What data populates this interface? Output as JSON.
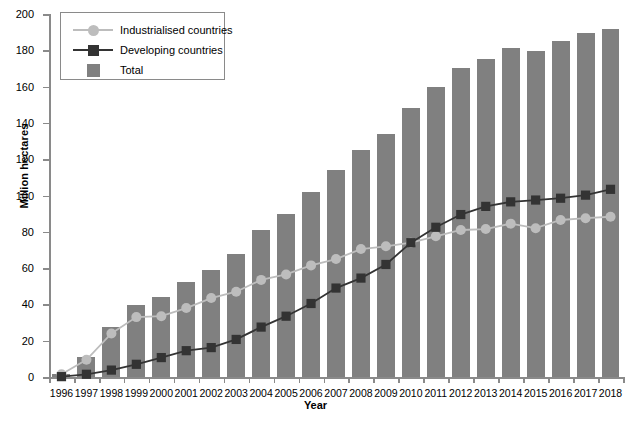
{
  "chart_data": {
    "type": "bar",
    "title": "",
    "xlabel": "Year",
    "ylabel": "Million hectares",
    "ylim": [
      0,
      200
    ],
    "ytick_step": 20,
    "yticks": [
      0,
      20,
      40,
      60,
      80,
      100,
      120,
      140,
      160,
      180,
      200
    ],
    "grid": false,
    "legend_position": "top-left",
    "categories": [
      "1996",
      "1997",
      "1998",
      "1999",
      "2000",
      "2001",
      "2002",
      "2003",
      "2004",
      "2005",
      "2006",
      "2007",
      "2008",
      "2009",
      "2010",
      "2011",
      "2012",
      "2013",
      "2014",
      "2015",
      "2016",
      "2017",
      "2018"
    ],
    "series": [
      {
        "name": "Total",
        "render": "bar",
        "color": "#808080",
        "values": [
          1.7,
          11.0,
          27.8,
          39.9,
          44.2,
          52.6,
          58.7,
          67.7,
          81.0,
          90.0,
          102.0,
          114.3,
          125.0,
          134.0,
          148.0,
          160.0,
          170.3,
          175.2,
          181.5,
          179.7,
          185.1,
          189.8,
          191.7
        ]
      },
      {
        "name": "Industrialised countries",
        "render": "line",
        "color": "#bdbdbd",
        "marker": "circle",
        "values": [
          1.5,
          9.5,
          24.0,
          33.0,
          33.5,
          38.0,
          43.5,
          47.0,
          53.5,
          56.5,
          61.5,
          65.0,
          70.5,
          72.0,
          74.0,
          77.5,
          81.0,
          81.5,
          84.5,
          82.0,
          86.5,
          87.5,
          88.3
        ]
      },
      {
        "name": "Developing countries",
        "render": "line",
        "color": "#333333",
        "marker": "square",
        "values": [
          0.2,
          1.5,
          3.8,
          7.0,
          10.7,
          14.5,
          16.2,
          20.7,
          27.5,
          33.5,
          40.5,
          49.0,
          54.5,
          62.0,
          74.0,
          82.5,
          89.5,
          94.0,
          96.5,
          97.5,
          98.5,
          100.2,
          103.4
        ]
      }
    ]
  },
  "legend": {
    "items": [
      {
        "label": "Industrialised countries",
        "marker": "circle",
        "color": "#bdbdbd"
      },
      {
        "label": "Developing countries",
        "marker": "square",
        "color": "#333333"
      },
      {
        "label": "Total",
        "marker": "patch",
        "color": "#808080"
      }
    ]
  }
}
